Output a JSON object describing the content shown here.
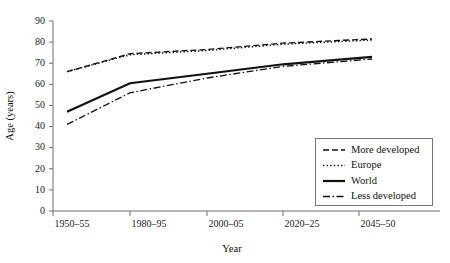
{
  "chart_data": {
    "type": "line",
    "title": "",
    "xlabel": "Year",
    "ylabel": "Age (years)",
    "categories": [
      "1950–55",
      "1980–95",
      "2000–05",
      "2020–25",
      "2045–50"
    ],
    "ylim": [
      0,
      90
    ],
    "yticks": [
      0,
      10,
      20,
      30,
      40,
      50,
      60,
      70,
      80,
      90
    ],
    "ytick_labels": [
      "0",
      "10",
      "20",
      "30",
      "40",
      "50",
      "60",
      "70",
      "80",
      "90"
    ],
    "grid": false,
    "legend_position": "center-right",
    "series": [
      {
        "name": "More developed",
        "style": "dashed",
        "values": [
          66.0,
          74.5,
          76.5,
          79.5,
          81.5
        ]
      },
      {
        "name": "Europe",
        "style": "dotted",
        "values": [
          66.0,
          74.0,
          76.0,
          79.0,
          81.0
        ]
      },
      {
        "name": "World",
        "style": "solid",
        "values": [
          47.0,
          60.5,
          65.0,
          69.5,
          73.0
        ]
      },
      {
        "name": "Less developed",
        "style": "dash-dot",
        "values": [
          41.0,
          56.0,
          63.0,
          68.5,
          72.0
        ]
      }
    ]
  },
  "legend": {
    "entries": [
      {
        "label": "More developed",
        "style": "dashed"
      },
      {
        "label": "Europe",
        "style": "dotted"
      },
      {
        "label": "World",
        "style": "solid"
      },
      {
        "label": "Less developed",
        "style": "dash-dot"
      }
    ]
  },
  "colors": {
    "line": "#111111",
    "axis": "#6f6f6f",
    "text": "#111111",
    "background": "#ffffff"
  }
}
